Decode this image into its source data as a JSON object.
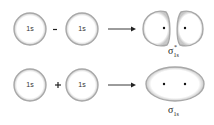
{
  "rows": [
    {
      "orbital_a": "1s",
      "operator": "−",
      "orbital_b": "1s",
      "result_label": "σ",
      "result_sup": "*",
      "result_sub": "1s",
      "result_shape": "antibonding-two-lobes"
    },
    {
      "orbital_a": "1s",
      "operator": "+",
      "orbital_b": "1s",
      "result_label": "σ",
      "result_sup": "",
      "result_sub": "1s",
      "result_shape": "bonding-ellipse"
    }
  ],
  "colors": {
    "outline": "#a8a8a8",
    "text": "#222222"
  }
}
